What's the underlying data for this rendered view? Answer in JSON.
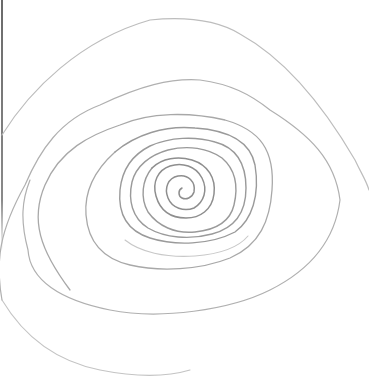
{
  "image": {
    "subject": "hand-drawn pencil spiral",
    "background_color": "#ffffff",
    "stroke_colors": {
      "outer": "#b8b8b8",
      "middle": "#a0a0a0",
      "inner": "#8c8c8c",
      "edge_line": "#6a6a6a"
    },
    "spiral_center": [
      180,
      188
    ]
  }
}
